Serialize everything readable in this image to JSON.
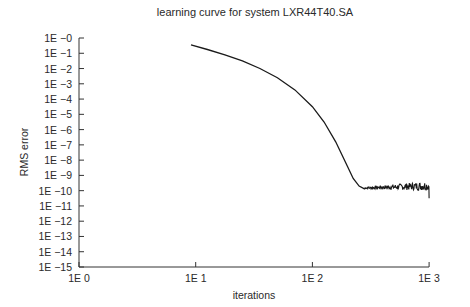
{
  "chart_data": {
    "type": "line",
    "title": "learning curve for system LXR44T40.SA",
    "xlabel": "iterations",
    "ylabel": "RMS error",
    "xscale": "log",
    "yscale": "log",
    "xlim": [
      1,
      1000
    ],
    "ylim": [
      1e-15,
      1
    ],
    "x_ticks": [
      "1E 0",
      "1E 1",
      "1E 2",
      "1E 3"
    ],
    "y_ticks": [
      "1E −0",
      "1E −1",
      "1E −2",
      "1E −3",
      "1E −4",
      "1E −5",
      "1E −6",
      "1E −7",
      "1E −8",
      "1E −9",
      "1E −10",
      "1E −11",
      "1E −12",
      "1E −13",
      "1E −14",
      "1E −15"
    ],
    "grid": false,
    "legend": null,
    "series": [
      {
        "name": "RMS error",
        "log10_x": [
          0.96,
          1.1,
          1.25,
          1.4,
          1.55,
          1.7,
          1.85,
          2.0,
          2.1,
          2.2,
          2.3,
          2.35,
          2.4,
          2.45,
          2.5,
          2.55,
          2.6,
          2.65,
          2.7,
          2.75,
          2.8,
          2.85,
          2.9,
          2.95,
          3.0
        ],
        "log10_y": [
          -0.45,
          -0.75,
          -1.1,
          -1.5,
          -2.0,
          -2.6,
          -3.4,
          -4.5,
          -5.5,
          -6.8,
          -8.4,
          -9.2,
          -9.7,
          -9.9,
          -9.8,
          -10.0,
          -9.7,
          -9.9,
          -9.8,
          -9.7,
          -9.9,
          -9.6,
          -9.8,
          -9.7,
          -10.4
        ]
      }
    ]
  }
}
